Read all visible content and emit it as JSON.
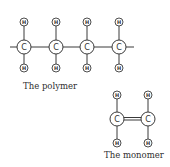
{
  "colors": {
    "line": "#3a3a3a",
    "background": "#ffffff",
    "text": "#2f2f2f"
  },
  "atom_labels": {
    "carbon": "C",
    "hydrogen": "H"
  },
  "polymer": {
    "caption": "The polymer",
    "carbon_count": 4,
    "carbons": [
      {
        "label": "C",
        "top_h": "H",
        "bottom_h": "H"
      },
      {
        "label": "C",
        "top_h": "H",
        "bottom_h": "H"
      },
      {
        "label": "C",
        "top_h": "H",
        "bottom_h": "H"
      },
      {
        "label": "C",
        "top_h": "H",
        "bottom_h": "H"
      }
    ],
    "chain_bonds": "single, open-ended both sides"
  },
  "monomer": {
    "caption": "The monomer",
    "carbons": [
      {
        "label": "C",
        "top_h": "H",
        "bottom_h": "H"
      },
      {
        "label": "C",
        "top_h": "H",
        "bottom_h": "H"
      }
    ],
    "carbon_bond": "double"
  }
}
